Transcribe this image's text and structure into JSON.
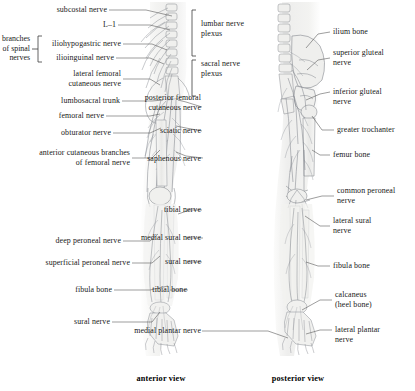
{
  "figure": {
    "title_left_caption": "anterior view",
    "title_right_caption": "posterior view",
    "style": {
      "ink": "#6d7076",
      "bone_fill": "#efefef",
      "limb_tint": "#f1f1ef",
      "leader": "#5d5d5d",
      "text": "#181818"
    }
  },
  "group_labels": {
    "branches_of_spinal_nerves": "branches\nof spinal\nnerves"
  },
  "left_labels": [
    {
      "id": "subcostal-nerve",
      "text": "subcostal nerve"
    },
    {
      "id": "l-1",
      "text": "L–1"
    },
    {
      "id": "iliohypogastric-nerve",
      "text": "iliohypogastric nerve"
    },
    {
      "id": "ilioinguinal-nerve",
      "text": "ilioinguinal nerve"
    },
    {
      "id": "lateral-femoral-cutaneous-nerve",
      "text": "lateral femoral\ncutaneous nerve"
    },
    {
      "id": "lumbosacral-trunk",
      "text": "lumbosacral trunk"
    },
    {
      "id": "femoral-nerve",
      "text": "femoral nerve"
    },
    {
      "id": "obturator-nerve",
      "text": "obturator nerve"
    },
    {
      "id": "anterior-cutaneous-branches-of-femoral-nerve",
      "text": "anterior cutaneous branches\nof femoral nerve"
    },
    {
      "id": "deep-peroneal-nerve",
      "text": "deep peroneal nerve"
    },
    {
      "id": "superficial-peroneal-nerve",
      "text": "superficial peroneal nerve"
    },
    {
      "id": "fibula-bone-left",
      "text": "fibula bone"
    },
    {
      "id": "sural-nerve-left",
      "text": "sural nerve"
    }
  ],
  "center_labels": [
    {
      "id": "lumbar-nerve-plexus",
      "text": "lumbar nerve\nplexus"
    },
    {
      "id": "sacral-nerve-plexus",
      "text": "sacral nerve\nplexus"
    },
    {
      "id": "posterior-femoral-cutaneous-nerve",
      "text": "posterior femoral\ncutaneous nerve"
    },
    {
      "id": "sciatic-nerve",
      "text": "sciatic nerve"
    },
    {
      "id": "saphenous-nerve",
      "text": "saphenous nerve"
    },
    {
      "id": "tibial-nerve",
      "text": "tibial nerve"
    },
    {
      "id": "medial-sural-nerve",
      "text": "medial sural nerve"
    },
    {
      "id": "sural-nerve-center",
      "text": "sural nerve"
    },
    {
      "id": "tibial-bone",
      "text": "tibial bone"
    },
    {
      "id": "medial-plantar-nerve",
      "text": "medial plantar nerve"
    }
  ],
  "right_labels": [
    {
      "id": "ilium-bone",
      "text": "ilium bone"
    },
    {
      "id": "superior-gluteal-nerve",
      "text": "superior gluteal\nnerve"
    },
    {
      "id": "inferior-gluteal-nerve",
      "text": "inferior gluteal\nnerve"
    },
    {
      "id": "greater-trochanter",
      "text": "greater trochanter"
    },
    {
      "id": "femur-bone",
      "text": "femur bone"
    },
    {
      "id": "common-peroneal-nerve",
      "text": "common peroneal\nnerve"
    },
    {
      "id": "lateral-sural-nerve",
      "text": "lateral sural\nnerve"
    },
    {
      "id": "fibula-bone-right",
      "text": "fibula bone"
    },
    {
      "id": "calcaneus",
      "text": "calcaneus\n(heel bone)"
    },
    {
      "id": "lateral-plantar-nerve",
      "text": "lateral plantar\nnerve"
    }
  ]
}
